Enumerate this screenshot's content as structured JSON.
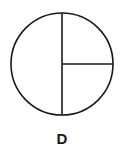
{
  "figure": {
    "label": "D",
    "shape": "circle divided into one half and two quarters",
    "stroke_color": "#1a1a1a",
    "fill_color": "#ffffff"
  }
}
